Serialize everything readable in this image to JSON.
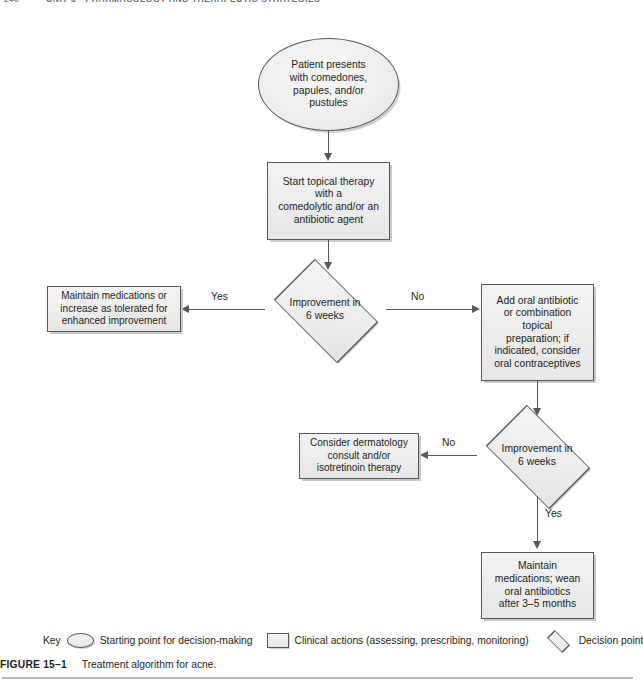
{
  "running_head": {
    "folio": "246",
    "text": "UNIT 3 • PHARMACOLOGY AND THERAPEUTIC STRATEGIES"
  },
  "figure": {
    "number": "FIGURE 15–1",
    "caption": "Treatment algorithm for acne."
  },
  "nodes": {
    "start": {
      "shape": "oval",
      "text": "Patient presents\nwith comedones,\npapules, and/or\npustules"
    },
    "topical_therapy": {
      "shape": "process",
      "text": "Start topical therapy\nwith a\ncomedolytic and/or an\nantibiotic agent"
    },
    "decision_one": {
      "shape": "decision",
      "text": "Improvement in\n6 weeks"
    },
    "maintain_increase": {
      "shape": "process",
      "text": "Maintain medications or\nincrease as tolerated for\nenhanced improvement"
    },
    "add_oral_antibiotic": {
      "shape": "process",
      "text": "Add oral antibiotic\nor combination\ntopical\npreparation; if\nindicated, consider\noral contraceptives"
    },
    "decision_two": {
      "shape": "decision",
      "text": "Improvement in\n6 weeks"
    },
    "dermatology_consult": {
      "shape": "process",
      "text": "Consider dermatology\nconsult and/or\nisotretinoin therapy"
    },
    "maintain_wean": {
      "shape": "process",
      "text": "Maintain\nmedications; wean\noral antibiotics\nafter 3–5 months"
    }
  },
  "edge_labels": {
    "yes_one": "Yes",
    "no_one": "No",
    "no_two": "No",
    "yes_two": "Yes"
  },
  "legend": {
    "title": "Key",
    "items": [
      {
        "shape": "oval",
        "label": "Starting point for decision-making"
      },
      {
        "shape": "rect",
        "label": "Clinical actions (assessing, prescribing, monitoring)"
      },
      {
        "shape": "diamond",
        "label": "Decision point"
      }
    ]
  },
  "colors": {
    "node_fill": "#eeeeee",
    "node_stroke": "#58585a",
    "shadow": "#cccccc",
    "text": "#231f20",
    "rule": "#b8b8b8"
  }
}
